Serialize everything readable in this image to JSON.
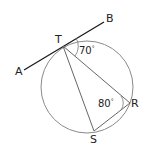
{
  "diagram": {
    "type": "circle-geometry",
    "points": {
      "A": {
        "label": "A"
      },
      "B": {
        "label": "B"
      },
      "T": {
        "label": "T"
      },
      "R": {
        "label": "R"
      },
      "S": {
        "label": "S"
      }
    },
    "angles": {
      "BTR": {
        "value": "70",
        "unit": "°"
      },
      "TRS": {
        "value": "80",
        "unit": "°"
      }
    },
    "colors": {
      "tangent": "#1a1a1a",
      "circle": "#888888",
      "chords": "#666666",
      "text": "#222222"
    }
  }
}
